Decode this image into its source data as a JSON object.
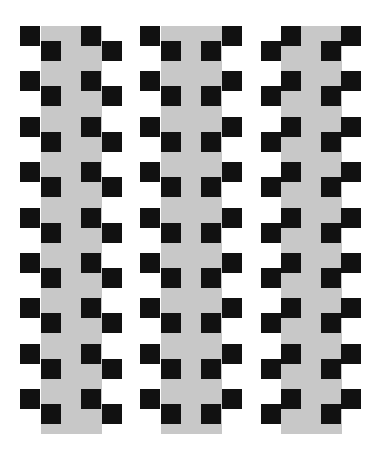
{
  "illusion": {
    "title": "",
    "colors": {
      "background": "#ffffff",
      "strip": "#c8c8c8",
      "square": "#111111"
    },
    "strip": {
      "top": 26,
      "height": 408,
      "width": 61
    },
    "square_size": 20,
    "row_count": 9,
    "row_start": 26,
    "row_pitch": 45.4,
    "step_offset": 15,
    "columns": [
      {
        "strip_x": 41,
        "pattern": "step-right",
        "squares": [
          {
            "dx": -21,
            "dy": 0
          },
          {
            "dx": 0,
            "dy": 15
          },
          {
            "dx": 40,
            "dy": 0
          },
          {
            "dx": 61,
            "dy": 15
          }
        ]
      },
      {
        "strip_x": 161,
        "pattern": "mirror",
        "squares": [
          {
            "dx": -21,
            "dy": 0
          },
          {
            "dx": 0,
            "dy": 15
          },
          {
            "dx": 40,
            "dy": 15
          },
          {
            "dx": 61,
            "dy": 0
          }
        ]
      },
      {
        "strip_x": 281,
        "pattern": "step-left",
        "squares": [
          {
            "dx": 0,
            "dy": 0
          },
          {
            "dx": -20,
            "dy": 15
          },
          {
            "dx": 60,
            "dy": 0
          },
          {
            "dx": 40,
            "dy": 15
          }
        ]
      }
    ]
  }
}
